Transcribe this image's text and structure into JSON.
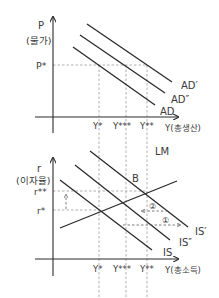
{
  "top_chart": {
    "y_axis_label": "P",
    "y_axis_sublabel": "(물가)",
    "x_axis_label": "Y(총생산)",
    "price_level_label": "P*",
    "x_ticks": [
      "Y*",
      "Y***",
      "Y**"
    ],
    "curves": [
      {
        "id": "AD",
        "label": "AD"
      },
      {
        "id": "AD2",
        "label": "AD″"
      },
      {
        "id": "AD1",
        "label": "AD′"
      }
    ]
  },
  "bottom_chart": {
    "y_axis_label": "r",
    "y_axis_sublabel": "(이자율)",
    "x_axis_label": "Y(총소득)",
    "rate_labels": [
      "r**",
      "r*"
    ],
    "x_ticks": [
      "Y*",
      "Y***",
      "Y**"
    ],
    "curves": [
      {
        "id": "LM",
        "label": "LM"
      },
      {
        "id": "IS",
        "label": "IS"
      },
      {
        "id": "IS2",
        "label": "IS″"
      },
      {
        "id": "IS1",
        "label": "IS′"
      }
    ],
    "point_label": "B",
    "arrow_labels": [
      "①",
      "②"
    ]
  },
  "colors": {
    "line": "#2a2a2a",
    "guide": "#9a9a9a",
    "text": "#3a3a3a"
  }
}
